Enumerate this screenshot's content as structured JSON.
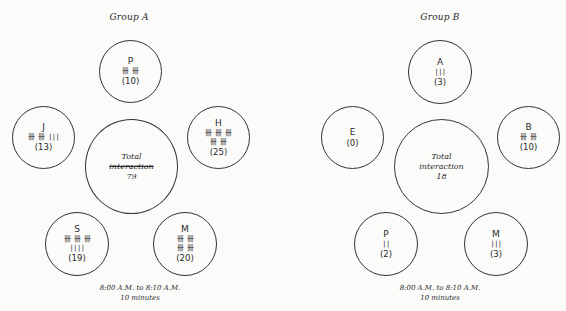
{
  "groups": [
    {
      "title": "Group A",
      "total_label_1": "Total",
      "total_label_2": "interaction",
      "total_value": "79",
      "members": [
        {
          "name": "P",
          "tally_1": "卌 卌",
          "tally_2": "",
          "count": "(10)"
        },
        {
          "name": "J",
          "tally_1": "卌 卌 |||",
          "tally_2": "",
          "count": "(13)"
        },
        {
          "name": "H",
          "tally_1": "卌 卌 卌",
          "tally_2": "卌 卌",
          "count": "(25)"
        },
        {
          "name": "S",
          "tally_1": "卌 卌 卌",
          "tally_2": "||||",
          "count": "(19)"
        },
        {
          "name": "M",
          "tally_1": "卌 卌",
          "tally_2": "卌 卌",
          "count": "(20)"
        }
      ],
      "footer_time": "8:00 A.M. to 8:10 A.M.",
      "footer_duration": "10 minutes"
    },
    {
      "title": "Group B",
      "total_label_1": "Total",
      "total_label_2": "interaction",
      "total_value": "18",
      "members": [
        {
          "name": "A",
          "tally_1": "|||",
          "tally_2": "",
          "count": "(3)"
        },
        {
          "name": "E",
          "tally_1": "",
          "tally_2": "",
          "count": "(0)"
        },
        {
          "name": "B",
          "tally_1": "卌 卌",
          "tally_2": "",
          "count": "(10)"
        },
        {
          "name": "P",
          "tally_1": "||",
          "tally_2": "",
          "count": "(2)"
        },
        {
          "name": "M",
          "tally_1": "|||",
          "tally_2": "",
          "count": "(3)"
        }
      ],
      "footer_time": "8:00 A.M. to 8:10 A.M.",
      "footer_duration": "10 minutes"
    }
  ]
}
